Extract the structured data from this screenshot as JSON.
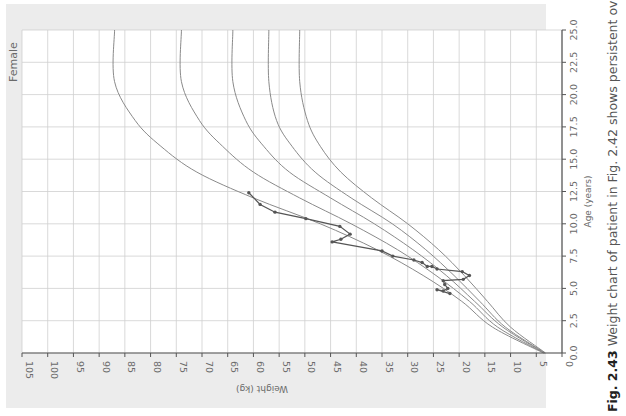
{
  "chart_data": {
    "type": "line",
    "orientation": "page rotated 90° clockwise (age axis vertical, weight axis horizontal, reversed)",
    "title": "Female",
    "xlabel": "Age (years)",
    "ylabel": "Weight (kg)",
    "xlim": [
      0,
      25
    ],
    "ylim": [
      0,
      105
    ],
    "x_ticks": [
      "0.0",
      "2.5",
      "5.0",
      "7.5",
      "10.0",
      "12.5",
      "15.0",
      "17.5",
      "20.0",
      "22.5",
      "25.0"
    ],
    "y_ticks": [
      "0",
      "5",
      "10",
      "15",
      "20",
      "25",
      "30",
      "35",
      "40",
      "45",
      "50",
      "55",
      "60",
      "65",
      "70",
      "75",
      "80",
      "85",
      "90",
      "95",
      "100",
      "105"
    ],
    "grid": true,
    "series": [
      {
        "name": "percentile curve 1 (lowest)",
        "x": [
          0,
          2,
          4,
          6,
          8,
          10,
          12,
          14,
          16,
          18,
          21,
          25
        ],
        "values": [
          3.2,
          10,
          14.5,
          19,
          24,
          30,
          37,
          43,
          47,
          49.5,
          51,
          51
        ]
      },
      {
        "name": "percentile curve 2",
        "x": [
          0,
          2,
          4,
          6,
          8,
          10,
          12,
          14,
          16,
          18,
          21,
          25
        ],
        "values": [
          3.3,
          11,
          16,
          21,
          26.5,
          33,
          41,
          48,
          52.5,
          55.5,
          57,
          57
        ]
      },
      {
        "name": "percentile curve 3",
        "x": [
          0,
          2,
          4,
          6,
          8,
          10,
          12,
          14,
          16,
          18,
          21,
          25
        ],
        "values": [
          3.4,
          11.5,
          17,
          22.5,
          29,
          36.5,
          45,
          53,
          58,
          61.5,
          64,
          64
        ]
      },
      {
        "name": "percentile curve 4",
        "x": [
          0,
          2,
          4,
          6,
          8,
          10,
          12,
          14,
          16,
          18,
          21,
          25
        ],
        "values": [
          3.5,
          12.5,
          18,
          24.5,
          32,
          41,
          51,
          60,
          66,
          70.5,
          74,
          74
        ]
      },
      {
        "name": "percentile curve 5 (highest)",
        "x": [
          0,
          2,
          4,
          6,
          8,
          10,
          12,
          14,
          16,
          18,
          21,
          25
        ],
        "values": [
          3.6,
          13.5,
          19.5,
          27,
          36,
          47,
          60,
          71,
          78,
          83,
          87,
          87
        ]
      },
      {
        "name": "patient weight",
        "x": [
          4.6,
          4.9,
          4.8,
          5.0,
          5.3,
          5.6,
          5.7,
          6.0,
          6.3,
          6.5,
          6.7,
          6.7,
          7.0,
          7.2,
          7.5,
          7.9,
          8.6,
          8.8,
          9.2,
          9.8,
          10.4,
          10.9,
          11.5,
          12.4
        ],
        "values": [
          21.8,
          24.3,
          23.1,
          22.2,
          22.8,
          23.1,
          19.2,
          18.0,
          19.4,
          24.3,
          25.3,
          26.2,
          27.2,
          28.8,
          32.9,
          35.0,
          44.7,
          43.0,
          41.2,
          43.2,
          49.8,
          55.8,
          58.7,
          60.9
        ]
      }
    ],
    "annotations": [
      "Female"
    ]
  },
  "caption": {
    "figure_number": "Fig. 2.43",
    "text": " Weight chart of patient in Fig. 2.42 shows persistent overweight"
  },
  "colors": {
    "panel": "#ececec",
    "plot_bg": "#ffffff",
    "grid": "#cfcfcf",
    "curve": "#8a8a8a",
    "patient": "#555555"
  }
}
